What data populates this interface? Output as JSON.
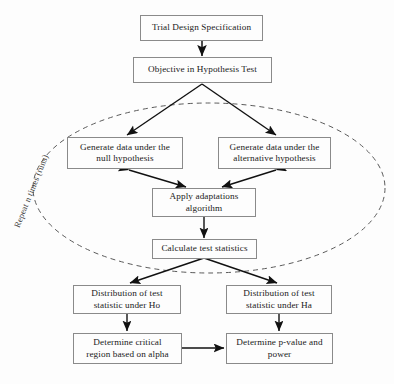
{
  "diagram": {
    "background_color": "#fdfdfd",
    "box_border_color": "#8a8a8a",
    "arrow_color": "#111111",
    "loop_color": "#5a5a5a",
    "nodes": [
      {
        "id": "trial-design-specification",
        "label": "Trial Design Specification"
      },
      {
        "id": "objective-in-hypothesis-test",
        "label": "Objective in Hypothesis Test"
      },
      {
        "id": "generate-data-null",
        "label": "Generate data under the\nnull hypothesis"
      },
      {
        "id": "generate-data-alternative",
        "label": "Generate data under the\nalternative hypothesis"
      },
      {
        "id": "apply-adaptations-algorithm",
        "label": "Apply adaptations\nalgorithm"
      },
      {
        "id": "calculate-test-statistics",
        "label": "Calculate test statistics"
      },
      {
        "id": "distribution-under-ho",
        "label": "Distribution of test\nstatistic under Ho"
      },
      {
        "id": "distribution-under-ha",
        "label": "Distribution of test\nstatistic under Ha"
      },
      {
        "id": "determine-critical-region",
        "label": "Determine critical\nregion based on alpha"
      },
      {
        "id": "determine-p-value-power",
        "label": "Determine p-value and\npower"
      }
    ],
    "loop": {
      "label": "Repeat n times (runs)",
      "style": "dashed-ellipse"
    }
  }
}
